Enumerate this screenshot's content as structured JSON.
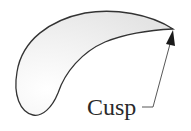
{
  "diagram": {
    "type": "annotated-shape",
    "shape": "crescent-cusp",
    "label": "Cusp",
    "colors": {
      "outline": "#333333",
      "fill_light": "#ffffff",
      "fill_shade": "#e6e6e6",
      "arrow": "#222222",
      "text": "#2a2a2a"
    }
  }
}
